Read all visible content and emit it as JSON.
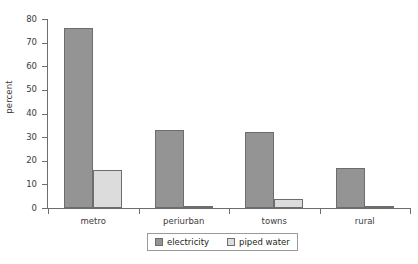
{
  "chart_data": {
    "type": "bar",
    "title": "",
    "subtitle": "",
    "xlabel": "",
    "ylabel": "percent",
    "categories": [
      "metro",
      "periurban",
      "towns",
      "rural"
    ],
    "series": [
      {
        "name": "electricity",
        "color": "#949494",
        "values": [
          76,
          33,
          32,
          17
        ]
      },
      {
        "name": "piped water",
        "color": "#dcdcdc",
        "values": [
          16,
          1,
          4,
          0.5
        ]
      }
    ],
    "ylim": [
      0,
      80
    ],
    "ytick_labels": [
      "0",
      "10",
      "20",
      "30",
      "40",
      "50",
      "60",
      "70",
      "80"
    ],
    "ytick_values": [
      0,
      10,
      20,
      30,
      40,
      50,
      60,
      70,
      80
    ],
    "grid": false,
    "legend_position": "bottom-center",
    "legend_entries": [
      "electricity",
      "piped water"
    ]
  },
  "axes": {
    "y_title": "percent",
    "y_ticks": [
      {
        "label": "80",
        "value": 80
      },
      {
        "label": "70",
        "value": 70
      },
      {
        "label": "60",
        "value": 60
      },
      {
        "label": "50",
        "value": 50
      },
      {
        "label": "40",
        "value": 40
      },
      {
        "label": "30",
        "value": 30
      },
      {
        "label": "20",
        "value": 20
      },
      {
        "label": "10",
        "value": 10
      },
      {
        "label": "0",
        "value": 0
      }
    ],
    "x_categories": [
      {
        "label": "metro"
      },
      {
        "label": "periurban"
      },
      {
        "label": "towns"
      },
      {
        "label": "rural"
      }
    ]
  },
  "legend": {
    "items": [
      {
        "label": "electricity",
        "color": "#949494"
      },
      {
        "label": "piped water",
        "color": "#dcdcdc"
      }
    ]
  },
  "colors": {
    "electricity": "#949494",
    "piped_water": "#dcdcdc",
    "axis": "#6e6e6e",
    "text": "#231f20",
    "background": "#ffffff"
  }
}
